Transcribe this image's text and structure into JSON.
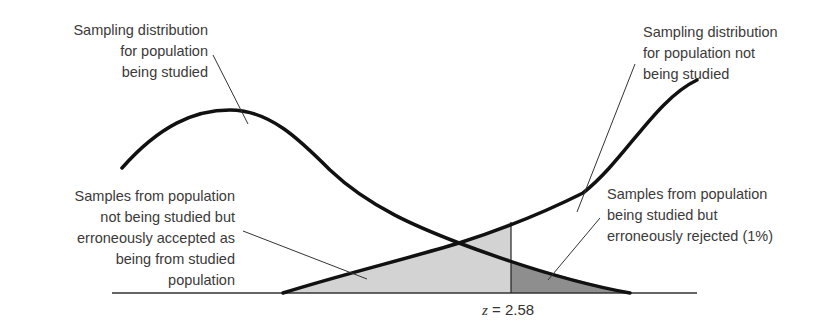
{
  "diagram": {
    "type": "overlapping-sampling-distributions",
    "labels": {
      "studied_distribution": "Sampling distribution\nfor population\nbeing studied",
      "not_studied_distribution": "Sampling distribution\nfor population not\nbeing studied",
      "type_ii_region": "Samples from population\nnot being studied but\nerroneously accepted as\nbeing from studied\npopulation",
      "type_i_region": "Samples from population\nbeing studied but\nerroneously rejected (1%)",
      "z_variable": "z",
      "z_equals": " = ",
      "z_value": "2.58"
    },
    "colors": {
      "curve": "#111111",
      "leader_line": "#333333",
      "light_shade": "#d3d3d3",
      "dark_shade": "#8e8e8e",
      "baseline": "#333333"
    },
    "critical_value": {
      "z": 2.58,
      "rejection_percent": "1%"
    }
  }
}
